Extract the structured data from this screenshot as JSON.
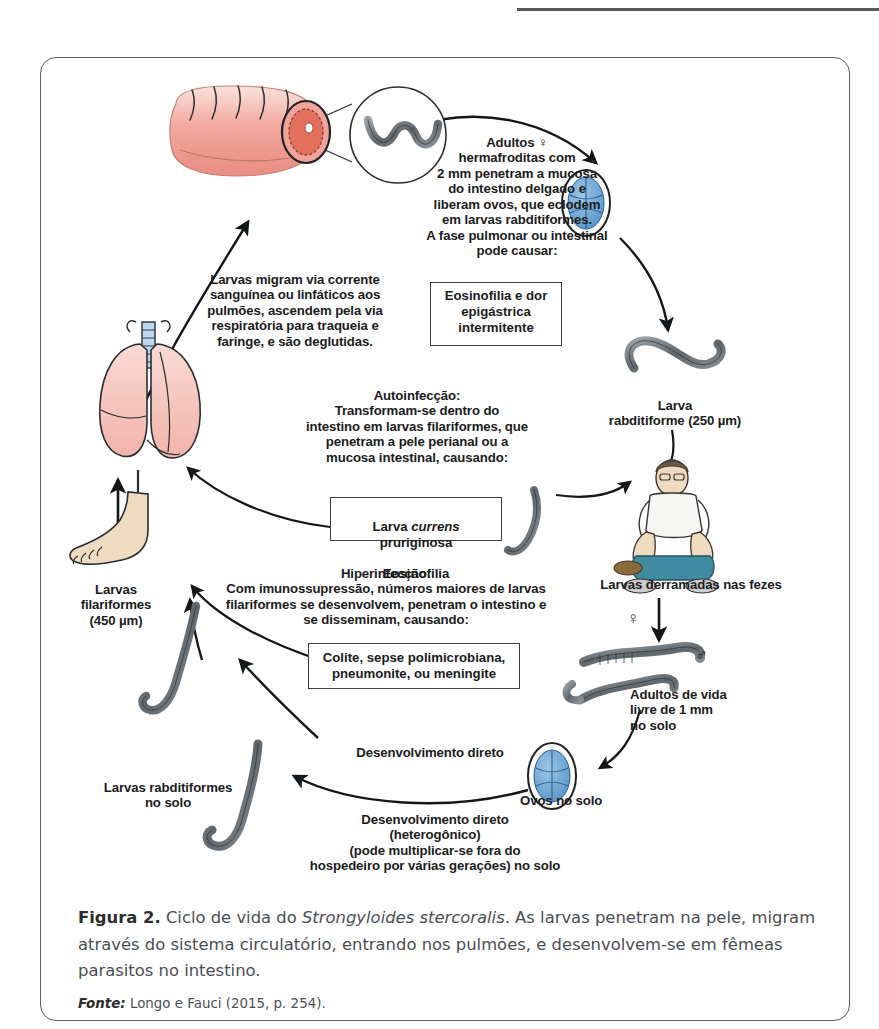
{
  "figure": {
    "frame_border_color": "#5b6063",
    "caption_label": "Figura 2.",
    "caption_text_1": " Ciclo de vida do ",
    "caption_species": "Strongyloides stercoralis",
    "caption_text_2": ". As larvas penetram na pele, migram através do sistema circulatório, entrando nos pulmões, e desenvolvem-se em fêmeas parasitos no intestino.",
    "source_label": "Fonte:",
    "source_text": " Longo e Fauci (2015, p. 254)."
  },
  "diagram": {
    "title": "Ciclo de vida do Strongyloides stercoralis",
    "colors": {
      "intestine_pink": "#f4a9a0",
      "lung_pink": "#f7c9c4",
      "egg_blue": "#6fa8d6",
      "skin_tone": "#efdcc0",
      "worm_gray": "#6d7478",
      "arrow_black": "#14171a",
      "trachea_blue": "#bcd9ef",
      "shirt_white": "#f6f6f4",
      "pants_teal": "#3f8ba0"
    },
    "labels": {
      "adults_block": "Adultos ♀\nhermafroditas com\n2 mm penetram a mucosa\ndo intestino delgado e\nliberam ovos, que eclodem\nem larvas rabditiformes.\nA fase pulmonar ou intestinal\npode causar:",
      "eosinophilia_box": "Eosinofilia e dor\nepigástrica\nintermitente",
      "migration_block": "Larvas migram via corrente\nsanguínea ou linfáticos aos\npulmões, ascendem pela via\nrespiratória para traqueia e\nfaringe, e são deglutidas.",
      "autoinfection_block": "Autoinfecção:\nTransformam-se dentro do\nintestino em larvas filariformes, que\npenetram a pele perianal ou a\nmucosa intestinal, causando:",
      "larva_currens_box_line1_pre": "Larva ",
      "larva_currens_box_italic": "currens",
      "larva_currens_box_line1_post": " pruriginosa",
      "larva_currens_box_line2": "Eosinofilia",
      "hyperinfection_block": "Hiperinfecção:\nCom imunossupressão, números maiores de larvas\nfilariformes se desenvolvem, penetram o intestino e\nse disseminam, causando:",
      "colitis_box": "Colite, sepse polimicrobiana,\npneumonite, ou meningite",
      "rhabditiform_larva": "Larva\nrabditiforme (250 µm)",
      "larvae_shed_feces": "Larvas derramadas nas fezes",
      "free_living_adults": "Adultos de vida\nlivre de 1 mm\nno solo",
      "eggs_in_soil": "Ovos no solo",
      "direct_development_upper": "Desenvolvimento direto",
      "direct_development_lower": "Desenvolvimento direto\n(heterogônico)\n(pode multiplicar-se fora do\nhospedeiro por várias gerações) no solo",
      "rhabditiform_larvae_soil": "Larvas rabditiformes\nno solo",
      "filariform_larvae": "Larvas\nfilariformes\n(450 µm)",
      "female_symbol": "♀",
      "male_symbol": "♂"
    }
  }
}
